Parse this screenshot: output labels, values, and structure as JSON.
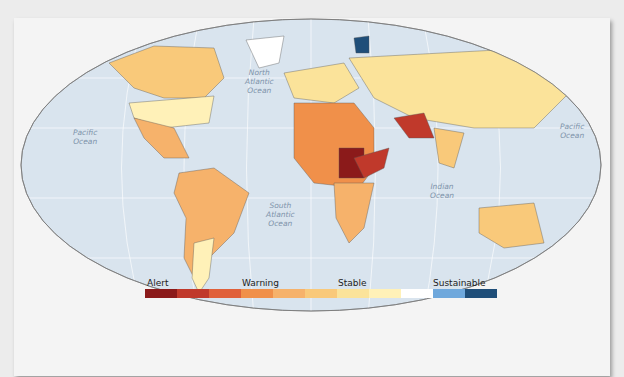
{
  "map": {
    "oceans": [
      {
        "name": "North Atlantic Ocean",
        "lines": [
          "North",
          "Atlantic",
          "Ocean"
        ]
      },
      {
        "name": "South Atlantic Ocean",
        "lines": [
          "South",
          "Atlantic",
          "Ocean"
        ]
      },
      {
        "name": "Pacific Ocean West",
        "lines": [
          "Pacific",
          "Ocean"
        ]
      },
      {
        "name": "Pacific Ocean East",
        "lines": [
          "Pacific",
          "Ocean"
        ]
      },
      {
        "name": "Indian Ocean",
        "lines": [
          "Indian",
          "Ocean"
        ]
      }
    ]
  },
  "legend": {
    "labels": [
      "Alert",
      "Warning",
      "Stable",
      "Sustainable"
    ],
    "swatches": [
      "#8b1a1a",
      "#c0392b",
      "#e0603a",
      "#f0904a",
      "#f6b26b",
      "#f9c97a",
      "#fbe39a",
      "#fff1b8",
      "#ffffff",
      "#6fa8dc",
      "#1f4e79"
    ]
  }
}
